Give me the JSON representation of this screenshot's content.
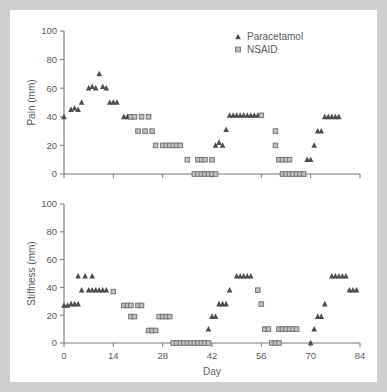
{
  "figure": {
    "background": "#cfcfcd",
    "panel_background": "#ffffff",
    "axis_color": "#7a7a7a",
    "paracetamol_color": "#4d4d4d",
    "nsaid_fill": "#bfbfbf",
    "nsaid_stroke": "#6e6e6e"
  },
  "legend": {
    "position": "top-right",
    "entries": [
      {
        "label": "Paracetamol",
        "marker": "triangle-up",
        "color": "#4d4d4d"
      },
      {
        "label": "NSAID",
        "marker": "square",
        "color": "#bfbfbf"
      }
    ]
  },
  "chart_data": [
    {
      "type": "scatter",
      "panel": "top",
      "title": "",
      "xlabel": "",
      "ylabel": "Pain (mm)",
      "xlim": [
        0,
        84
      ],
      "ylim": [
        0,
        100
      ],
      "xticks": [
        0,
        14,
        28,
        42,
        56,
        70,
        84
      ],
      "xticklabels": [
        "0",
        "14",
        "28",
        "42",
        "56",
        "70",
        "84"
      ],
      "yticks": [
        0,
        20,
        40,
        60,
        80,
        100
      ],
      "yticklabels": [
        "0",
        "20",
        "40",
        "60",
        "80",
        "100"
      ],
      "grid": false,
      "series": [
        {
          "name": "Paracetamol",
          "marker": "triangle-up",
          "points": [
            [
              0,
              40
            ],
            [
              2,
              45
            ],
            [
              3,
              46
            ],
            [
              4,
              45
            ],
            [
              5,
              50
            ],
            [
              7,
              60
            ],
            [
              8,
              61
            ],
            [
              9,
              60
            ],
            [
              10,
              70
            ],
            [
              11,
              61
            ],
            [
              12,
              60
            ],
            [
              13,
              50
            ],
            [
              14,
              50
            ],
            [
              15,
              50
            ],
            [
              17,
              40
            ],
            [
              18,
              40
            ],
            [
              19,
              40
            ],
            [
              40,
              0
            ],
            [
              41,
              0
            ],
            [
              42,
              0
            ],
            [
              43,
              20
            ],
            [
              44,
              22
            ],
            [
              45,
              20
            ],
            [
              46,
              31
            ],
            [
              47,
              41
            ],
            [
              48,
              41
            ],
            [
              49,
              41
            ],
            [
              50,
              41
            ],
            [
              51,
              41
            ],
            [
              52,
              41
            ],
            [
              53,
              41
            ],
            [
              54,
              41
            ],
            [
              55,
              41
            ],
            [
              56,
              41
            ],
            [
              67,
              0
            ],
            [
              68,
              0
            ],
            [
              69,
              10
            ],
            [
              70,
              10
            ],
            [
              71,
              20
            ],
            [
              72,
              30
            ],
            [
              73,
              30
            ],
            [
              74,
              40
            ],
            [
              75,
              40
            ],
            [
              76,
              40
            ],
            [
              77,
              40
            ],
            [
              78,
              40
            ]
          ]
        },
        {
          "name": "NSAID",
          "marker": "square",
          "points": [
            [
              19,
              40
            ],
            [
              20,
              40
            ],
            [
              22,
              40
            ],
            [
              24,
              40
            ],
            [
              21,
              30
            ],
            [
              23,
              30
            ],
            [
              25,
              30
            ],
            [
              26,
              20
            ],
            [
              28,
              20
            ],
            [
              29,
              20
            ],
            [
              30,
              20
            ],
            [
              31,
              20
            ],
            [
              32,
              20
            ],
            [
              33,
              20
            ],
            [
              35,
              10
            ],
            [
              38,
              10
            ],
            [
              39,
              10
            ],
            [
              40,
              10
            ],
            [
              42,
              10
            ],
            [
              37,
              0
            ],
            [
              38,
              0
            ],
            [
              39,
              0
            ],
            [
              40,
              0
            ],
            [
              41,
              0
            ],
            [
              42,
              0
            ],
            [
              43,
              0
            ],
            [
              56,
              41
            ],
            [
              60,
              30
            ],
            [
              60,
              20
            ],
            [
              61,
              10
            ],
            [
              62,
              10
            ],
            [
              63,
              10
            ],
            [
              64,
              10
            ],
            [
              62,
              0
            ],
            [
              63,
              0
            ],
            [
              64,
              0
            ],
            [
              65,
              0
            ],
            [
              66,
              0
            ],
            [
              67,
              0
            ],
            [
              68,
              0
            ]
          ]
        }
      ]
    },
    {
      "type": "scatter",
      "panel": "bottom",
      "title": "",
      "xlabel": "Day",
      "ylabel": "Stiffness (mm)",
      "xlim": [
        0,
        84
      ],
      "ylim": [
        0,
        100
      ],
      "xticks": [
        0,
        14,
        28,
        42,
        56,
        70,
        84
      ],
      "xticklabels": [
        "0",
        "14",
        "28",
        "42",
        "56",
        "70",
        "84"
      ],
      "yticks": [
        0,
        20,
        40,
        60,
        80,
        100
      ],
      "yticklabels": [
        "0",
        "20",
        "40",
        "60",
        "80",
        "100"
      ],
      "grid": false,
      "series": [
        {
          "name": "Paracetamol",
          "marker": "triangle-up",
          "points": [
            [
              0,
              27
            ],
            [
              1,
              27
            ],
            [
              2,
              28
            ],
            [
              3,
              28
            ],
            [
              4,
              28
            ],
            [
              4,
              48
            ],
            [
              6,
              48
            ],
            [
              8,
              48
            ],
            [
              5,
              38
            ],
            [
              7,
              38
            ],
            [
              8,
              38
            ],
            [
              9,
              38
            ],
            [
              10,
              38
            ],
            [
              11,
              38
            ],
            [
              12,
              38
            ],
            [
              41,
              10
            ],
            [
              42,
              19
            ],
            [
              43,
              19
            ],
            [
              44,
              28
            ],
            [
              45,
              28
            ],
            [
              46,
              28
            ],
            [
              47,
              38
            ],
            [
              49,
              48
            ],
            [
              50,
              48
            ],
            [
              51,
              48
            ],
            [
              52,
              48
            ],
            [
              53,
              48
            ],
            [
              70,
              0
            ],
            [
              71,
              10
            ],
            [
              72,
              19
            ],
            [
              73,
              19
            ],
            [
              74,
              28
            ],
            [
              76,
              48
            ],
            [
              77,
              48
            ],
            [
              78,
              48
            ],
            [
              79,
              48
            ],
            [
              80,
              48
            ],
            [
              81,
              38
            ],
            [
              82,
              38
            ],
            [
              83,
              38
            ]
          ]
        },
        {
          "name": "NSAID",
          "marker": "square",
          "points": [
            [
              14,
              37
            ],
            [
              17,
              27
            ],
            [
              18,
              27
            ],
            [
              19,
              27
            ],
            [
              21,
              27
            ],
            [
              22,
              27
            ],
            [
              19,
              19
            ],
            [
              20,
              19
            ],
            [
              24,
              9
            ],
            [
              25,
              9
            ],
            [
              26,
              9
            ],
            [
              27,
              19
            ],
            [
              28,
              19
            ],
            [
              29,
              19
            ],
            [
              30,
              19
            ],
            [
              31,
              0
            ],
            [
              32,
              0
            ],
            [
              33,
              0
            ],
            [
              34,
              0
            ],
            [
              35,
              0
            ],
            [
              36,
              0
            ],
            [
              37,
              0
            ],
            [
              38,
              0
            ],
            [
              39,
              0
            ],
            [
              40,
              0
            ],
            [
              41,
              0
            ],
            [
              55,
              38
            ],
            [
              56,
              28
            ],
            [
              57,
              10
            ],
            [
              58,
              10
            ],
            [
              59,
              0
            ],
            [
              60,
              0
            ],
            [
              61,
              0
            ],
            [
              61,
              10
            ],
            [
              62,
              10
            ],
            [
              63,
              10
            ],
            [
              64,
              10
            ],
            [
              65,
              10
            ],
            [
              66,
              10
            ]
          ]
        }
      ]
    }
  ]
}
